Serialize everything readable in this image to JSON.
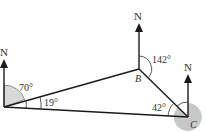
{
  "diagram": {
    "type": "bearings-triangle",
    "points": {
      "A": {
        "label": "",
        "x": 4,
        "y": 107
      },
      "B": {
        "label": "B",
        "x": 139,
        "y": 69
      },
      "C": {
        "label": "C",
        "x": 188,
        "y": 117
      }
    },
    "north_label": "N",
    "angles": {
      "a_bearing": "70°",
      "a_interior": "19°",
      "b_bearing": "142°",
      "c_interior": "42°"
    },
    "colors": {
      "line": "#1a1a1a",
      "shade": "#c8c8c8",
      "text": "#333333"
    }
  }
}
